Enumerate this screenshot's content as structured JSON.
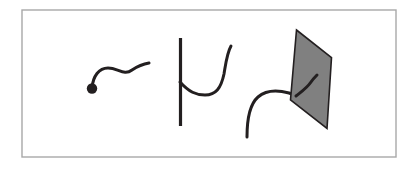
{
  "figure": {
    "canvas": {
      "width": 419,
      "height": 172,
      "background": "#ffffff"
    },
    "frame": {
      "label": "figure-border",
      "x": 22,
      "y": 10,
      "width": 374,
      "height": 147,
      "stroke": "#a8a8a8",
      "stroke_width": 1.4,
      "fill": "#ffffff"
    },
    "style": {
      "curve_stroke": "#231f20",
      "curve_width": 3.0,
      "line_width": 3.2,
      "plane_fill": "#808080",
      "plane_stroke": "#231f20",
      "plane_stroke_width": 1.6,
      "dot_fill": "#231f20",
      "dot_radius": 5.2
    },
    "panels": [
      {
        "name": "panel-curve-with-endpoint",
        "description": "Free curve with a marked endpoint",
        "elements": [
          {
            "name": "curve-path",
            "type": "path",
            "d": "M 92 88 C 93 76, 99 68, 108 68 C 118 68, 124 76, 132 70 C 138 66, 143 64, 149 63"
          },
          {
            "name": "endpoint-dot",
            "type": "dot",
            "cx": 92,
            "cy": 88.5,
            "r": 5.2
          }
        ]
      },
      {
        "name": "panel-curve-meets-line",
        "description": "Curve attached to a vertical line",
        "elements": [
          {
            "name": "vertical-line",
            "type": "line",
            "x1": 180.5,
            "y1": 38,
            "x2": 180.5,
            "y2": 126
          },
          {
            "name": "curve-path",
            "type": "path",
            "d": "M 180 82 C 189 92, 196 95, 205 95 C 216 95, 221 88, 224 74 C 226 62, 227 53, 231 46"
          }
        ]
      },
      {
        "name": "panel-curve-meets-plane",
        "description": "Curve passing into a shaded plane",
        "elements": [
          {
            "name": "curve-path-outside",
            "type": "path",
            "d": "M 247 137 C 247 118, 250 104, 258 97 C 266 90, 278 90, 289 93 C 292 94, 295 95, 297 96"
          },
          {
            "name": "plane-polygon",
            "type": "polygon",
            "points": "296.5,30 331.5,57.5 327,128.5 290.5,100"
          },
          {
            "name": "curve-path-inside",
            "type": "path",
            "d": "M 296 96 C 301 92, 307 88, 311 82 C 313 79, 315 77, 317 75"
          }
        ]
      }
    ]
  }
}
